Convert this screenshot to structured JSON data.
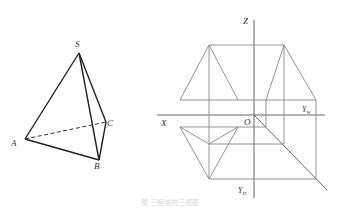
{
  "pyramid": {
    "labels": {
      "S": "S",
      "A": "A",
      "B": "B",
      "C": "C"
    },
    "edge_color": "#222222",
    "hidden_edge": "AC"
  },
  "projection": {
    "axis_labels": {
      "z": "Z",
      "x": "X",
      "o": "O",
      "yw": "Y",
      "yw_sub": "W",
      "yh": "Y",
      "yh_sub": "H"
    },
    "line_color": "#888888",
    "axis_color": "#555555"
  },
  "caption": "图 三棱锥的三视图"
}
